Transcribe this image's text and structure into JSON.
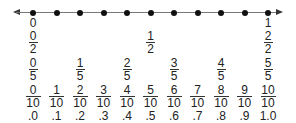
{
  "diagram": {
    "type": "number-line",
    "range": [
      0,
      1
    ],
    "tick_count": 11,
    "arrows": "both",
    "rows": {
      "wholes": [
        {
          "position": 0,
          "text": "0"
        },
        {
          "position": 10,
          "text": "1"
        }
      ],
      "halves": [
        {
          "position": 0,
          "num": "0",
          "den": "2"
        },
        {
          "position": 5,
          "num": "1",
          "den": "2"
        },
        {
          "position": 10,
          "num": "2",
          "den": "2"
        }
      ],
      "fifths": [
        {
          "position": 0,
          "num": "0",
          "den": "5"
        },
        {
          "position": 2,
          "num": "1",
          "den": "5"
        },
        {
          "position": 4,
          "num": "2",
          "den": "5"
        },
        {
          "position": 6,
          "num": "3",
          "den": "5"
        },
        {
          "position": 8,
          "num": "4",
          "den": "5"
        },
        {
          "position": 10,
          "num": "5",
          "den": "5"
        }
      ],
      "tenths": [
        {
          "position": 0,
          "num": "0",
          "den": "10"
        },
        {
          "position": 1,
          "num": "1",
          "den": "10"
        },
        {
          "position": 2,
          "num": "2",
          "den": "10"
        },
        {
          "position": 3,
          "num": "3",
          "den": "10"
        },
        {
          "position": 4,
          "num": "4",
          "den": "10"
        },
        {
          "position": 5,
          "num": "5",
          "den": "10"
        },
        {
          "position": 6,
          "num": "6",
          "den": "10"
        },
        {
          "position": 7,
          "num": "7",
          "den": "10"
        },
        {
          "position": 8,
          "num": "8",
          "den": "10"
        },
        {
          "position": 9,
          "num": "9",
          "den": "10"
        },
        {
          "position": 10,
          "num": "10",
          "den": "10"
        }
      ],
      "decimals": [
        {
          "position": 0,
          "text": ".0"
        },
        {
          "position": 1,
          "text": ".1"
        },
        {
          "position": 2,
          "text": ".2"
        },
        {
          "position": 3,
          "text": ".3"
        },
        {
          "position": 4,
          "text": ".4"
        },
        {
          "position": 5,
          "text": ".5"
        },
        {
          "position": 6,
          "text": ".6"
        },
        {
          "position": 7,
          "text": ".7"
        },
        {
          "position": 8,
          "text": ".8"
        },
        {
          "position": 9,
          "text": ".9"
        },
        {
          "position": 10,
          "text": "1.0"
        }
      ]
    }
  }
}
